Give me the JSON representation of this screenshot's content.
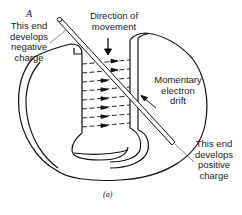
{
  "diagram": {
    "point_label": "A",
    "labels": {
      "negative_end": [
        "This end",
        "develops",
        "negative",
        "charge"
      ],
      "direction": [
        "Direction of",
        "movement"
      ],
      "electron_drift": [
        "Momentary",
        "electron",
        "drift"
      ],
      "positive_end": [
        "This end",
        "develops",
        "positive",
        "charge"
      ]
    },
    "caption": "(a)",
    "field_arrow_count": 8
  }
}
